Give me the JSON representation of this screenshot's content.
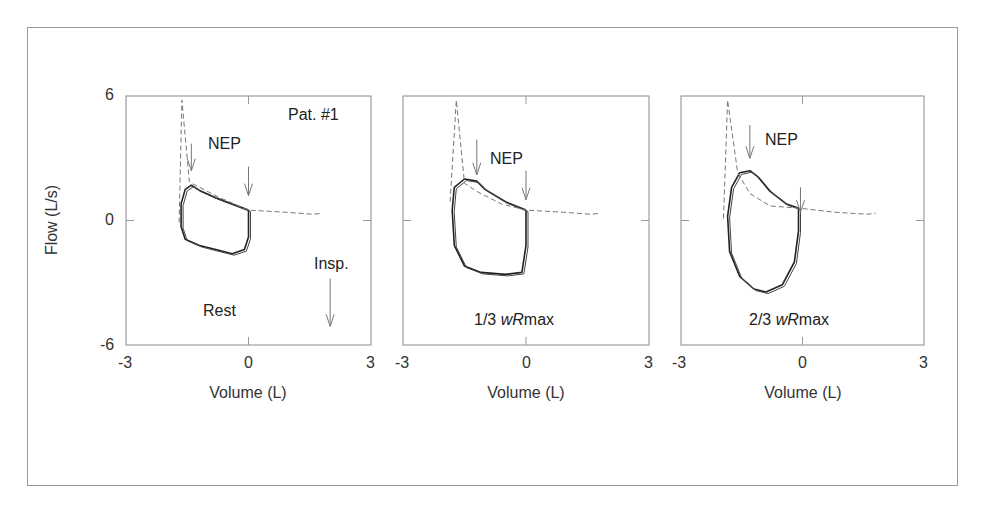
{
  "chart_data": [
    {
      "type": "line",
      "title": "Rest",
      "panel_label": "Pat. #1",
      "xlabel": "Volume (L)",
      "ylabel": "Flow (L/s)",
      "xlim": [
        -3,
        3
      ],
      "ylim": [
        -6,
        6
      ],
      "xticks": [
        -3,
        0,
        3
      ],
      "yticks": [
        -6,
        0,
        6
      ],
      "grid": false,
      "annotations": [
        "NEP",
        "Insp.",
        "Rest",
        "Pat. #1"
      ],
      "arrows": [
        {
          "label": "NEP",
          "x": -1.4,
          "y_from": 3.7,
          "y_to": 2.4
        },
        {
          "label": "NEP",
          "x": 0.0,
          "y_from": 2.6,
          "y_to": 1.2
        },
        {
          "label": "Insp.",
          "x": 2.0,
          "y_from": -2.8,
          "y_to": -5.1
        }
      ],
      "series": [
        {
          "name": "tidal loop (solid)",
          "style": "solid",
          "points": [
            [
              0,
              0.5
            ],
            [
              -0.4,
              0.8
            ],
            [
              -0.8,
              1.1
            ],
            [
              -1.2,
              1.45
            ],
            [
              -1.4,
              1.7
            ],
            [
              -1.55,
              1.5
            ],
            [
              -1.65,
              0.8
            ],
            [
              -1.65,
              -0.3
            ],
            [
              -1.55,
              -0.9
            ],
            [
              -1.2,
              -1.2
            ],
            [
              -0.8,
              -1.4
            ],
            [
              -0.4,
              -1.6
            ],
            [
              -0.1,
              -1.4
            ],
            [
              0,
              -0.8
            ],
            [
              0,
              0.5
            ]
          ]
        },
        {
          "name": "NEP response (dashed)",
          "style": "dashed",
          "points": [
            [
              -1.7,
              -0.1
            ],
            [
              -1.63,
              5.8
            ],
            [
              -1.45,
              1.9
            ],
            [
              -1.4,
              1.8
            ],
            [
              -0.7,
              1.1
            ],
            [
              0,
              0.5
            ],
            [
              0.9,
              0.4
            ],
            [
              1.6,
              0.3
            ],
            [
              1.8,
              0.35
            ]
          ]
        }
      ]
    },
    {
      "type": "line",
      "title": "1/3 wRmax",
      "xlabel": "Volume (L)",
      "ylabel": "",
      "xlim": [
        -3,
        3
      ],
      "ylim": [
        -6,
        6
      ],
      "xticks": [
        -3,
        0,
        3
      ],
      "grid": false,
      "annotations": [
        "NEP",
        "1/3 wRmax"
      ],
      "arrows": [
        {
          "label": "NEP",
          "x": -1.2,
          "y_from": 3.9,
          "y_to": 2.2
        },
        {
          "label": "NEP",
          "x": 0.0,
          "y_from": 2.4,
          "y_to": 1.0
        }
      ],
      "series": [
        {
          "name": "tidal loop (solid)",
          "style": "solid",
          "points": [
            [
              0,
              0.5
            ],
            [
              -0.5,
              0.9
            ],
            [
              -1.0,
              1.5
            ],
            [
              -1.2,
              1.9
            ],
            [
              -1.5,
              2.0
            ],
            [
              -1.75,
              1.6
            ],
            [
              -1.8,
              0.5
            ],
            [
              -1.75,
              -1.2
            ],
            [
              -1.5,
              -2.2
            ],
            [
              -1.1,
              -2.5
            ],
            [
              -0.5,
              -2.6
            ],
            [
              -0.1,
              -2.5
            ],
            [
              0,
              -1.2
            ],
            [
              0,
              0.5
            ]
          ]
        },
        {
          "name": "NEP response (dashed)",
          "style": "dashed",
          "points": [
            [
              -1.85,
              0.9
            ],
            [
              -1.7,
              5.8
            ],
            [
              -1.5,
              1.8
            ],
            [
              -1.2,
              1.4
            ],
            [
              -0.6,
              0.8
            ],
            [
              0,
              0.5
            ],
            [
              0.9,
              0.4
            ],
            [
              1.6,
              0.3
            ],
            [
              1.8,
              0.35
            ]
          ]
        }
      ]
    },
    {
      "type": "line",
      "title": "2/3 wRmax",
      "xlabel": "Volume (L)",
      "ylabel": "",
      "xlim": [
        -3,
        3
      ],
      "ylim": [
        -6,
        6
      ],
      "xticks": [
        -3,
        0,
        3
      ],
      "grid": false,
      "annotations": [
        "NEP",
        "2/3 wRmax"
      ],
      "arrows": [
        {
          "label": "NEP",
          "x": -1.3,
          "y_from": 4.6,
          "y_to": 3.0
        },
        {
          "label": "NEP",
          "x": -0.05,
          "y_from": 1.6,
          "y_to": 0.4
        }
      ],
      "series": [
        {
          "name": "tidal loop (solid)",
          "style": "solid",
          "points": [
            [
              -0.1,
              0.6
            ],
            [
              -0.4,
              0.8
            ],
            [
              -0.8,
              1.4
            ],
            [
              -1.1,
              2.1
            ],
            [
              -1.3,
              2.4
            ],
            [
              -1.55,
              2.3
            ],
            [
              -1.75,
              1.6
            ],
            [
              -1.85,
              0.2
            ],
            [
              -1.8,
              -1.5
            ],
            [
              -1.55,
              -2.7
            ],
            [
              -1.2,
              -3.3
            ],
            [
              -0.9,
              -3.45
            ],
            [
              -0.5,
              -3.1
            ],
            [
              -0.2,
              -2.0
            ],
            [
              -0.1,
              -0.5
            ],
            [
              -0.1,
              0.6
            ]
          ]
        },
        {
          "name": "NEP response (dashed)",
          "style": "dashed",
          "points": [
            [
              -1.95,
              0.1
            ],
            [
              -1.85,
              5.8
            ],
            [
              -1.6,
              2.3
            ],
            [
              -1.3,
              1.3
            ],
            [
              -0.8,
              0.7
            ],
            [
              -0.1,
              0.6
            ],
            [
              0.8,
              0.4
            ],
            [
              1.6,
              0.3
            ],
            [
              1.8,
              0.35
            ]
          ]
        }
      ]
    }
  ],
  "labels": {
    "ylabel": "Flow (L/s)",
    "xlabel": "Volume (L)",
    "ytick_top": "6",
    "ytick_mid": "0",
    "ytick_bot": "-6",
    "xtick_left": "-3",
    "xtick_mid": "0",
    "xtick_right": "3",
    "pat": "Pat. #1",
    "nep": "NEP",
    "insp": "Insp.",
    "rest": "Rest",
    "p2_title_prefix": "1/3 ",
    "p3_title_prefix": "2/3 ",
    "wR": "wR",
    "max": "max"
  }
}
